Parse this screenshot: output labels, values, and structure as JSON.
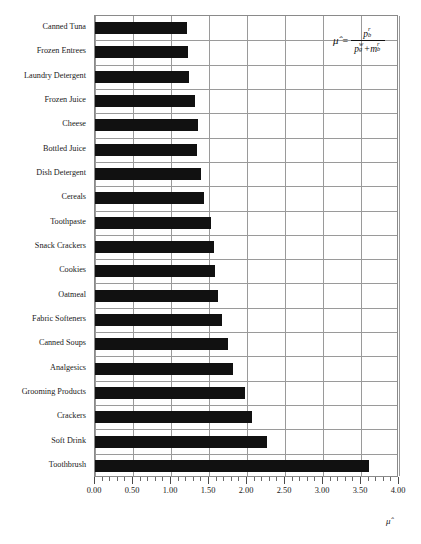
{
  "chart_data": {
    "type": "bar",
    "orientation": "horizontal",
    "title": "",
    "subtitle": "",
    "xlabel": "μ̂",
    "ylabel": "",
    "xlim": [
      0.0,
      4.0
    ],
    "grid": true,
    "legend": null,
    "categories": [
      "Canned Tuna",
      "Frozen Entrees",
      "Laundry Detergent",
      "Frozen Juice",
      "Cheese",
      "Bottled Juice",
      "Dish Detergent",
      "Cereals",
      "Toothpaste",
      "Snack Crackers",
      "Cookies",
      "Oatmeal",
      "Fabric Softeners",
      "Canned Soups",
      "Analgesics",
      "Grooming Products",
      "Crackers",
      "Soft Drink",
      "Toothbrush"
    ],
    "values": [
      1.21,
      1.23,
      1.24,
      1.32,
      1.35,
      1.34,
      1.4,
      1.44,
      1.53,
      1.57,
      1.58,
      1.62,
      1.67,
      1.75,
      1.81,
      1.97,
      2.07,
      2.26,
      3.6
    ],
    "bar_color": "#111111",
    "grid_color": "#9a9a9a",
    "xticks": [
      0.0,
      0.5,
      1.0,
      1.5,
      2.0,
      2.5,
      3.0,
      3.5,
      4.0
    ],
    "xtick_labels": [
      "0.00",
      "0.50",
      "1.00",
      "1.50",
      "2.00",
      "2.50",
      "3.00",
      "3.50",
      "4.00"
    ],
    "major_gridlines": [
      0.0,
      0.5,
      1.0,
      1.5,
      2.0,
      2.5,
      3.0,
      3.5,
      4.0
    ],
    "minor_tick_step": 0.1,
    "annotation": {
      "name": "mu-hat-formula",
      "lhs": "μ̂",
      "equals": "=",
      "numerator_base": "p",
      "numerator_sup": "r",
      "numerator_sub": "b",
      "denominator_term1_base": "p",
      "denominator_term1_sup": "w",
      "denominator_term1_sub": "g",
      "denominator_plus": "+",
      "denominator_term2_base": "m",
      "denominator_term2_sup": "r",
      "denominator_term2_sub": "b",
      "plain_text": "mu-hat = p_b^r / (p_g^w + m_b^r)"
    }
  }
}
